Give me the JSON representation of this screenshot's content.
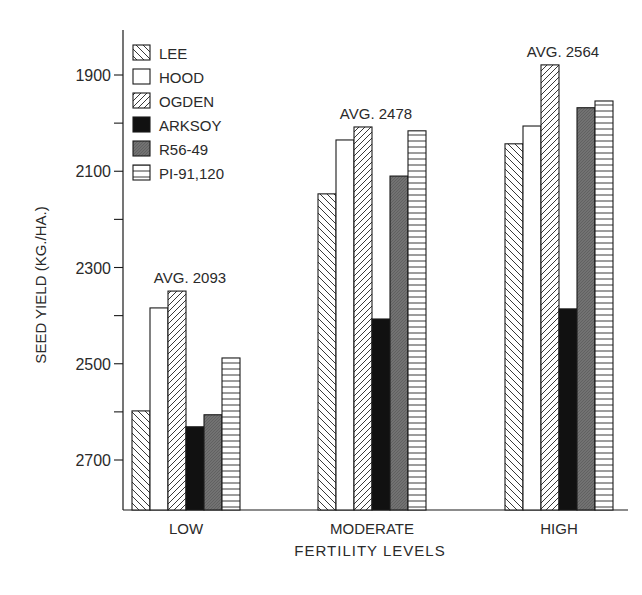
{
  "chart_data": {
    "type": "bar",
    "title": "",
    "xlabel": "FERTILITY LEVELS",
    "ylabel": "SEED YIELD (KG./HA.)",
    "ylim": [
      1786,
      2800
    ],
    "yticks": [
      1900,
      2100,
      2300,
      2500,
      2700
    ],
    "yminor_ticks": [
      2000,
      2200,
      2400,
      2600
    ],
    "grid": false,
    "legend_position": "top-left inside",
    "categories": [
      "LOW",
      "MODERATE",
      "HIGH"
    ],
    "annotations": [
      "AVG. 2093",
      "AVG. 2478",
      "AVG. 2564"
    ],
    "series": [
      {
        "name": "LEE",
        "pattern": "back-diagonal-hatch",
        "values": [
          2002,
          2453,
          2557
        ]
      },
      {
        "name": "HOOD",
        "pattern": "white",
        "values": [
          2216,
          2565,
          2594
        ]
      },
      {
        "name": "OGDEN",
        "pattern": "forward-diagonal-hatch",
        "values": [
          2251,
          2592,
          2721
        ]
      },
      {
        "name": "ARKSOY",
        "pattern": "solid-black",
        "values": [
          1969,
          2193,
          2214
        ]
      },
      {
        "name": "R56-49",
        "pattern": "gray-stipple",
        "values": [
          1994,
          2490,
          2632
        ]
      },
      {
        "name": "PI-91,120",
        "pattern": "horizontal-lines",
        "values": [
          2112,
          2584,
          2646
        ]
      }
    ]
  },
  "labels": {
    "ylabel": "SEED YIELD (KG./HA.)",
    "xlabel": "FERTILITY LEVELS",
    "yticks": [
      "2700",
      "2500",
      "2300",
      "2100",
      "1900"
    ],
    "categories": [
      "LOW",
      "MODERATE",
      "HIGH"
    ],
    "averages": [
      "AVG. 2093",
      "AVG. 2478",
      "AVG. 2564"
    ],
    "legend": [
      "LEE",
      "HOOD",
      "OGDEN",
      "ARKSOY",
      "R56-49",
      "PI-91,120"
    ]
  },
  "colors": {
    "ink": "#1a1a1a",
    "gray_fill": "#6e6e6e",
    "background": "#ffffff"
  }
}
